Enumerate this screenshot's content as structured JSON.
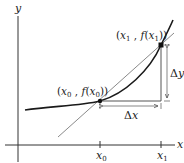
{
  "diagram": {
    "axes": {
      "x_label": "x",
      "y_label": "y"
    },
    "ticks": {
      "x0": "x",
      "x0_sub": "0",
      "x1": "x",
      "x1_sub": "1"
    },
    "points": {
      "p0": {
        "open": "(",
        "x": "x",
        "xsub": "0",
        "mid": " , ",
        "f": "f",
        "fopen": "(",
        "fx": "x",
        "fxsub": "0",
        "close": "))"
      },
      "p1": {
        "open": "(",
        "x": "x",
        "xsub": "1",
        "mid": " , ",
        "f": "f",
        "fopen": "(",
        "fx": "x",
        "fxsub": "1",
        "close": "))"
      }
    },
    "deltas": {
      "dx_symbol": "Δ",
      "dx_var": "x",
      "dy_symbol": "Δ",
      "dy_var": "y"
    },
    "colors": {
      "curve": "#1a1a1a",
      "secant": "#8a8a8a",
      "axis": "#333333",
      "guide": "#555555"
    }
  }
}
